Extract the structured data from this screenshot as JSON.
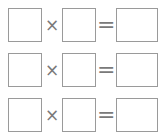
{
  "worksheet": {
    "rows": [
      {
        "operator": "×",
        "equals": "=",
        "operand1": "",
        "operand2": "",
        "result": ""
      },
      {
        "operator": "×",
        "equals": "=",
        "operand1": "",
        "operand2": "",
        "result": ""
      },
      {
        "operator": "×",
        "equals": "=",
        "operand1": "",
        "operand2": "",
        "result": ""
      }
    ]
  }
}
